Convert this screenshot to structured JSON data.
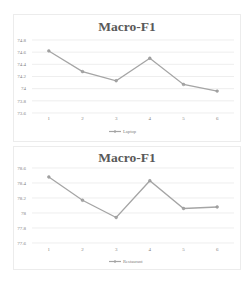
{
  "chart_data": [
    {
      "type": "line",
      "title": "Macro-F1",
      "xlabel": "",
      "ylabel": "",
      "categories": [
        "1",
        "2",
        "3",
        "4",
        "5",
        "6"
      ],
      "series": [
        {
          "name": "Laptop",
          "values": [
            74.62,
            74.28,
            74.13,
            74.5,
            74.07,
            73.96
          ],
          "color": "#a5a5a5"
        }
      ],
      "yticks": [
        "74.8",
        "74.6",
        "74.4",
        "74.2",
        "74",
        "73.8",
        "73.6"
      ],
      "ylim": [
        73.6,
        74.8
      ],
      "grid": true,
      "legend_position": "bottom"
    },
    {
      "type": "line",
      "title": "Macro-F1",
      "xlabel": "",
      "ylabel": "",
      "categories": [
        "1",
        "2",
        "3",
        "4",
        "5",
        "6"
      ],
      "series": [
        {
          "name": "Restaurant",
          "values": [
            78.48,
            78.17,
            77.94,
            78.43,
            78.06,
            78.08
          ],
          "color": "#a5a5a5"
        }
      ],
      "yticks": [
        "78.6",
        "78.4",
        "78.2",
        "78",
        "77.8",
        "77.6"
      ],
      "ylim": [
        77.6,
        78.6
      ],
      "grid": true,
      "legend_position": "bottom"
    }
  ],
  "charts": {
    "top": {
      "title": "Macro-F1",
      "legend": "Laptop"
    },
    "bottom": {
      "title": "Macro-F1",
      "legend": "Restaurant"
    }
  }
}
